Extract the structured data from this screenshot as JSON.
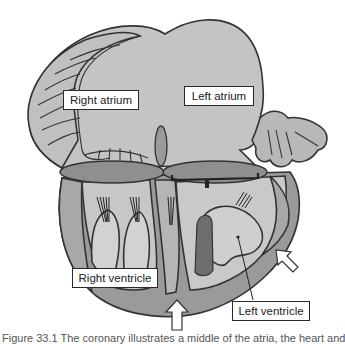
{
  "labels": {
    "right_atrium": "Right atrium",
    "left_atrium": "Left atrium",
    "right_ventricle": "Right ventricle",
    "left_ventricle": "Left ventricle"
  },
  "caption": "Figure 33.1 The coronary illustrates a middle of the atria, the heart and",
  "colors": {
    "atrium_fill": "#c4c4c4",
    "ventricle_wall": "#9a9a9a",
    "ventricle_inner": "#c9c9c9",
    "outline": "#3a3a3a",
    "dark_cavity": "#6e6e6e",
    "valve": "#8f8f8f"
  },
  "arrows": [
    {
      "name": "bottom-arrow",
      "direction": "up"
    },
    {
      "name": "right-arrow",
      "direction": "up-left"
    }
  ]
}
